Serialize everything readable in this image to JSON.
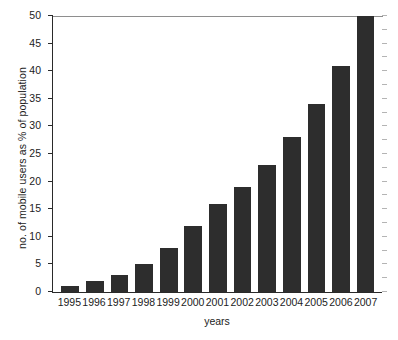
{
  "chart_data": {
    "type": "bar",
    "title": "",
    "xlabel": "years",
    "ylabel": "no. of mobile users as % of population",
    "categories": [
      "1995",
      "1996",
      "1997",
      "1998",
      "1999",
      "2000",
      "2001",
      "2002",
      "2003",
      "2004",
      "2005",
      "2006",
      "2007"
    ],
    "values": [
      1,
      2,
      3,
      5,
      8,
      12,
      16,
      19,
      23,
      28,
      34,
      41,
      50
    ],
    "ylim": [
      0,
      50
    ],
    "ytick_labels": [
      "0",
      "5",
      "10",
      "15",
      "20",
      "25",
      "30",
      "35",
      "40",
      "45",
      "50"
    ],
    "ytick_values": [
      0,
      5,
      10,
      15,
      20,
      25,
      30,
      35,
      40,
      45,
      50
    ],
    "grid": false,
    "legend": "none",
    "bar_color": "#2d2d2d",
    "axis_color": "#2a2a2a",
    "background": "#ffffff"
  }
}
